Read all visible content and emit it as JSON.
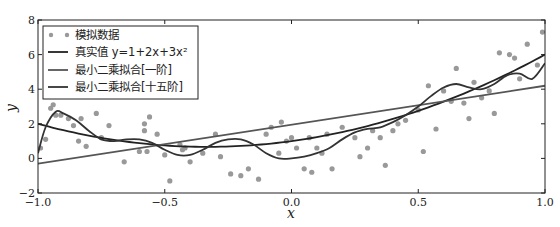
{
  "chart_data": {
    "type": "line",
    "title": "",
    "xlabel": "x",
    "ylabel": "y",
    "xlim": [
      -1.0,
      1.0
    ],
    "ylim": [
      -2,
      8
    ],
    "xticks": [
      "−1.0",
      "−0.5",
      "0.0",
      "0.5",
      "1.0"
    ],
    "yticks": [
      "−2",
      "0",
      "2",
      "4",
      "6",
      "8"
    ],
    "grid": false,
    "legend_position": "upper left",
    "legend": [
      "模拟数据",
      "真实值 y=1+2x+3x²",
      "最小二乘拟合[一阶]",
      "最小二乘拟合[十五阶]"
    ],
    "series": [
      {
        "name": "模拟数据",
        "kind": "scatter",
        "color": "#999999",
        "points": [
          [
            -0.99,
            0.6
          ],
          [
            -0.97,
            1.1
          ],
          [
            -0.95,
            2.9
          ],
          [
            -0.94,
            3.1
          ],
          [
            -0.93,
            2.5
          ],
          [
            -0.91,
            2.5
          ],
          [
            -0.88,
            2.3
          ],
          [
            -0.86,
            1.9
          ],
          [
            -0.84,
            1.0
          ],
          [
            -0.83,
            2.3
          ],
          [
            -0.81,
            0.7
          ],
          [
            -0.77,
            2.6
          ],
          [
            -0.75,
            1.2
          ],
          [
            -0.72,
            1.9
          ],
          [
            -0.66,
            -0.2
          ],
          [
            -0.6,
            0.4
          ],
          [
            -0.58,
            2.0
          ],
          [
            -0.58,
            1.6
          ],
          [
            -0.57,
            0.4
          ],
          [
            -0.56,
            2.4
          ],
          [
            -0.53,
            1.4
          ],
          [
            -0.5,
            0.2
          ],
          [
            -0.48,
            -1.3
          ],
          [
            -0.44,
            0.8
          ],
          [
            -0.43,
            0.5
          ],
          [
            -0.42,
            0.6
          ],
          [
            -0.4,
            -0.2
          ],
          [
            -0.35,
            0.3
          ],
          [
            -0.3,
            1.4
          ],
          [
            -0.28,
            0.1
          ],
          [
            -0.24,
            -0.9
          ],
          [
            -0.2,
            -1.0
          ],
          [
            -0.17,
            -0.6
          ],
          [
            -0.13,
            -1.2
          ],
          [
            -0.1,
            1.4
          ],
          [
            -0.08,
            1.8
          ],
          [
            -0.05,
            0.3
          ],
          [
            -0.04,
            2.1
          ],
          [
            -0.02,
            1.0
          ],
          [
            0.0,
            1.2
          ],
          [
            0.02,
            0.6
          ],
          [
            0.05,
            -0.6
          ],
          [
            0.07,
            1.2
          ],
          [
            0.08,
            -0.8
          ],
          [
            0.1,
            0.6
          ],
          [
            0.12,
            0.3
          ],
          [
            0.14,
            1.4
          ],
          [
            0.16,
            -0.6
          ],
          [
            0.2,
            1.8
          ],
          [
            0.25,
            1.2
          ],
          [
            0.27,
            0.1
          ],
          [
            0.3,
            0.6
          ],
          [
            0.32,
            1.6
          ],
          [
            0.35,
            1.2
          ],
          [
            0.37,
            -0.4
          ],
          [
            0.4,
            1.6
          ],
          [
            0.42,
            2.0
          ],
          [
            0.45,
            2.2
          ],
          [
            0.5,
            2.8
          ],
          [
            0.52,
            0.4
          ],
          [
            0.54,
            4.2
          ],
          [
            0.57,
            1.7
          ],
          [
            0.6,
            3.9
          ],
          [
            0.63,
            3.3
          ],
          [
            0.65,
            5.2
          ],
          [
            0.68,
            3.2
          ],
          [
            0.7,
            2.3
          ],
          [
            0.72,
            4.4
          ],
          [
            0.75,
            3.5
          ],
          [
            0.78,
            3.9
          ],
          [
            0.8,
            2.6
          ],
          [
            0.82,
            6.1
          ],
          [
            0.86,
            6.0
          ],
          [
            0.88,
            5.8
          ],
          [
            0.9,
            4.6
          ],
          [
            0.93,
            6.6
          ],
          [
            0.97,
            5.4
          ],
          [
            0.99,
            7.3
          ]
        ]
      },
      {
        "name": "真实值 y=1+2x+3x²",
        "kind": "line",
        "color": "#222222"
      },
      {
        "name": "最小二乘拟合[一阶]",
        "kind": "line",
        "color": "#555555",
        "x": [
          -1.0,
          1.0
        ],
        "y": [
          -0.3,
          4.2
        ]
      },
      {
        "name": "最小二乘拟合[十五阶]",
        "kind": "line",
        "color": "#333333",
        "x": [
          -1.0,
          -0.97,
          -0.93,
          -0.9,
          -0.85,
          -0.8,
          -0.75,
          -0.7,
          -0.65,
          -0.6,
          -0.55,
          -0.5,
          -0.45,
          -0.4,
          -0.35,
          -0.3,
          -0.25,
          -0.2,
          -0.15,
          -0.1,
          -0.05,
          0.0,
          0.05,
          0.1,
          0.15,
          0.2,
          0.25,
          0.3,
          0.35,
          0.4,
          0.45,
          0.5,
          0.55,
          0.6,
          0.65,
          0.7,
          0.75,
          0.8,
          0.85,
          0.9,
          0.95,
          1.0
        ],
        "y": [
          0.3,
          1.8,
          2.7,
          2.6,
          2.2,
          1.6,
          1.1,
          1.0,
          1.1,
          1.1,
          0.9,
          0.5,
          0.2,
          0.2,
          0.5,
          0.9,
          1.1,
          1.1,
          0.8,
          0.3,
          0.0,
          0.0,
          0.1,
          0.3,
          0.6,
          1.1,
          1.5,
          1.7,
          1.8,
          2.1,
          2.5,
          3.0,
          3.6,
          4.1,
          4.3,
          4.1,
          4.0,
          4.3,
          4.8,
          4.9,
          4.6,
          5.5
        ]
      }
    ]
  }
}
